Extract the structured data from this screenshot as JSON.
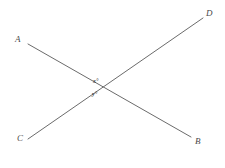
{
  "figure": {
    "background_color": "#ffffff",
    "line_color": "#6b6b6b",
    "label_color": "#4a4a4a",
    "segments": [
      {
        "name": "segment-AB",
        "from_label": "A",
        "to_label": "B",
        "x1": 28,
        "y1": 44,
        "x2": 191,
        "y2": 137
      },
      {
        "name": "segment-CD",
        "from_label": "C",
        "to_label": "D",
        "x1": 28,
        "y1": 139,
        "x2": 203,
        "y2": 18
      }
    ],
    "intersection": {
      "x": 100,
      "y": 88
    },
    "vertex_labels": [
      {
        "id": "A",
        "text": "A"
      },
      {
        "id": "D",
        "text": "D"
      },
      {
        "id": "C",
        "text": "C"
      },
      {
        "id": "B",
        "text": "B"
      }
    ],
    "angle_labels": [
      {
        "id": "x",
        "text": "x°",
        "position": "above-intersection"
      },
      {
        "id": "y",
        "text": "y°",
        "position": "below-intersection"
      }
    ]
  }
}
